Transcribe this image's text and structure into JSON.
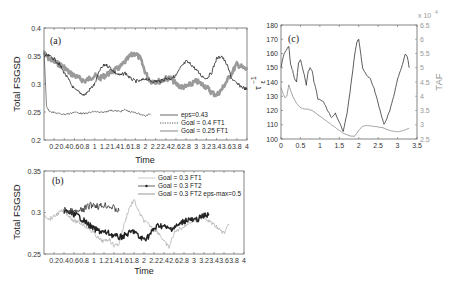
{
  "chart_data": [
    {
      "panel": "(a)",
      "type": "line",
      "xlabel": "Time",
      "ylabel": "Total  FSGSD",
      "xlim": [
        0,
        4
      ],
      "ylim": [
        0.2,
        0.4
      ],
      "xticks": [
        "0.2",
        "0.4",
        "0.6",
        "0.8",
        "1",
        "1.2",
        "1.4",
        "1.6",
        "1.8",
        "2",
        "2.2",
        "2.4",
        "2.6",
        "2.8",
        "3",
        "3.2",
        "3.4",
        "3.6",
        "3.8",
        "4"
      ],
      "yticks": [
        "0.2",
        "0.25",
        "0.3",
        "0.35",
        "0.4"
      ],
      "legend_position": "lower right",
      "series": [
        {
          "name": "eps=0.43",
          "style": "gray-thick-markers",
          "color": "#9a9a9a",
          "x": [
            0,
            0.1,
            0.2,
            0.3,
            0.4,
            0.5,
            0.6,
            0.7,
            0.8,
            0.9,
            1.0,
            1.1,
            1.2,
            1.3,
            1.4,
            1.5,
            1.6,
            1.7,
            1.8,
            1.9,
            2.0,
            2.1,
            2.2,
            2.3,
            2.4,
            2.5,
            2.6,
            2.7,
            2.8,
            2.9,
            3.0,
            3.1,
            3.2,
            3.3,
            3.4,
            3.5,
            3.6,
            3.7,
            3.8,
            3.9,
            4.0
          ],
          "y": [
            0.355,
            0.345,
            0.34,
            0.335,
            0.33,
            0.32,
            0.315,
            0.31,
            0.305,
            0.31,
            0.315,
            0.31,
            0.315,
            0.32,
            0.325,
            0.33,
            0.34,
            0.35,
            0.355,
            0.345,
            0.32,
            0.305,
            0.305,
            0.305,
            0.31,
            0.31,
            0.3,
            0.295,
            0.295,
            0.3,
            0.305,
            0.3,
            0.295,
            0.285,
            0.28,
            0.29,
            0.305,
            0.32,
            0.335,
            0.33,
            0.325
          ]
        },
        {
          "name": "Goal = 0.4   FT1",
          "style": "black-dotted",
          "color": "#222222",
          "x": [
            0,
            0.1,
            0.2,
            0.3,
            0.4,
            0.5,
            0.6,
            0.7,
            0.8,
            0.9,
            1.0,
            1.1,
            1.2,
            1.3,
            1.4,
            1.5,
            1.6,
            1.7,
            1.8,
            1.9,
            2.0,
            2.1,
            2.2,
            2.3,
            2.4,
            2.5,
            2.6,
            2.7,
            2.8,
            2.9,
            3.0,
            3.1,
            3.2,
            3.3,
            3.4,
            3.5,
            3.6,
            3.7,
            3.8,
            3.9,
            4.0
          ],
          "y": [
            0.35,
            0.35,
            0.345,
            0.335,
            0.32,
            0.305,
            0.29,
            0.285,
            0.28,
            0.29,
            0.3,
            0.325,
            0.335,
            0.33,
            0.32,
            0.315,
            0.32,
            0.31,
            0.305,
            0.305,
            0.31,
            0.305,
            0.305,
            0.305,
            0.31,
            0.31,
            0.315,
            0.33,
            0.34,
            0.335,
            0.325,
            0.315,
            0.31,
            0.32,
            0.345,
            0.35,
            0.335,
            0.31,
            0.3,
            0.295,
            0.29
          ]
        },
        {
          "name": "Goal = 0.25   FT1",
          "style": "black-thin",
          "color": "#333333",
          "x": [
            0,
            0.05,
            0.1,
            0.2,
            0.3,
            0.4,
            0.5,
            0.6,
            0.7,
            0.8,
            0.9,
            1.0,
            1.1,
            1.2,
            1.3,
            1.4,
            1.5,
            1.6,
            1.7,
            1.8,
            1.9,
            2.0,
            2.1
          ],
          "y": [
            0.36,
            0.26,
            0.252,
            0.249,
            0.247,
            0.246,
            0.247,
            0.25,
            0.248,
            0.247,
            0.249,
            0.251,
            0.249,
            0.25,
            0.253,
            0.252,
            0.251,
            0.254,
            0.25,
            0.249,
            0.246,
            0.243,
            0.247
          ]
        }
      ]
    },
    {
      "panel": "(b)",
      "type": "line",
      "xlabel": "Time",
      "ylabel": "Total  FSGSD",
      "xlim": [
        0,
        4
      ],
      "ylim": [
        0.25,
        0.35
      ],
      "xticks": [
        "0.2",
        "0.4",
        "0.6",
        "0.8",
        "1",
        "1.2",
        "1.4",
        "1.6",
        "1.8",
        "2",
        "2.2",
        "2.4",
        "2.6",
        "2.8",
        "3",
        "3.2",
        "3.4",
        "3.6",
        "3.8",
        "4"
      ],
      "yticks": [
        "0.25",
        "0.3",
        "0.35"
      ],
      "legend_position": "upper right",
      "series": [
        {
          "name": "Goal = 0.3   FT1",
          "style": "light-gray-thin",
          "color": "#aaaaaa",
          "x": [
            0,
            0.1,
            0.2,
            0.3,
            0.4,
            0.5,
            0.6,
            0.7,
            0.8,
            0.9,
            1.0,
            1.1,
            1.2,
            1.3,
            1.4,
            1.5,
            1.6,
            1.7,
            1.8,
            1.9,
            2.0,
            2.1,
            2.2,
            2.3,
            2.4,
            2.5,
            2.6,
            2.7,
            2.8,
            2.9,
            3.0,
            3.1,
            3.2,
            3.3,
            3.4,
            3.5,
            3.6,
            3.7
          ],
          "y": [
            0.298,
            0.292,
            0.295,
            0.3,
            0.302,
            0.296,
            0.29,
            0.288,
            0.285,
            0.28,
            0.275,
            0.268,
            0.265,
            0.268,
            0.26,
            0.262,
            0.285,
            0.305,
            0.315,
            0.3,
            0.29,
            0.285,
            0.28,
            0.275,
            0.265,
            0.258,
            0.275,
            0.28,
            0.283,
            0.288,
            0.29,
            0.292,
            0.295,
            0.29,
            0.285,
            0.28,
            0.275,
            0.285
          ]
        },
        {
          "name": "Goal = 0.3   FT2",
          "style": "black-markers",
          "color": "#222222",
          "x": [
            0.4,
            0.5,
            0.6,
            0.7,
            0.8,
            0.9,
            1.0,
            1.1,
            1.2,
            1.3,
            1.4,
            1.5,
            1.6,
            1.7,
            1.8,
            1.9,
            2.0,
            2.1,
            2.2,
            2.3,
            2.4,
            2.5,
            2.6,
            2.7,
            2.8,
            2.9,
            3.0,
            3.1,
            3.2,
            3.3
          ],
          "y": [
            0.302,
            0.3,
            0.298,
            0.295,
            0.29,
            0.285,
            0.28,
            0.278,
            0.276,
            0.275,
            0.272,
            0.27,
            0.272,
            0.275,
            0.278,
            0.27,
            0.268,
            0.272,
            0.28,
            0.285,
            0.283,
            0.28,
            0.282,
            0.285,
            0.29,
            0.292,
            0.29,
            0.293,
            0.296,
            0.298
          ]
        },
        {
          "name": "Goal = 0.3   FT2   eps-max=0.5",
          "style": "black-thin-upper",
          "color": "#333333",
          "x": [
            0.4,
            0.5,
            0.6,
            0.7,
            0.8,
            0.9,
            1.0,
            1.1,
            1.2,
            1.3,
            1.4,
            1.5
          ],
          "y": [
            0.303,
            0.302,
            0.3,
            0.301,
            0.304,
            0.308,
            0.31,
            0.307,
            0.309,
            0.308,
            0.305,
            0.302
          ]
        }
      ]
    },
    {
      "panel": "(c)",
      "type": "line",
      "xlabel": "",
      "ylabel": "τ_ε^-1",
      "ylabel2": "TAF",
      "y2_multiplier": "x 10^4",
      "xlim": [
        0,
        3.5
      ],
      "ylim": [
        100,
        180
      ],
      "y2lim": [
        2.5,
        6.5
      ],
      "xticks": [
        "0",
        "0.5",
        "1",
        "1.5",
        "2",
        "2.5",
        "3",
        "3.5"
      ],
      "yticks": [
        "100",
        "110",
        "120",
        "130",
        "140",
        "150",
        "160",
        "170",
        "180"
      ],
      "y2ticks": [
        "2.5",
        "3",
        "3.5",
        "4",
        "4.5",
        "5",
        "5.5",
        "6",
        "6.5"
      ],
      "series": [
        {
          "name": "tau_eps^-1",
          "axis": "left",
          "color": "#333333",
          "x": [
            0,
            0.05,
            0.1,
            0.15,
            0.2,
            0.25,
            0.3,
            0.35,
            0.4,
            0.45,
            0.5,
            0.55,
            0.6,
            0.65,
            0.7,
            0.75,
            0.8,
            0.85,
            0.9,
            0.95,
            1.0,
            1.1,
            1.2,
            1.3,
            1.4,
            1.5,
            1.6,
            1.7,
            1.8,
            1.9,
            1.95,
            2.0,
            2.05,
            2.1,
            2.2,
            2.3,
            2.4,
            2.5,
            2.6,
            2.65,
            2.7,
            2.8,
            2.9,
            3.0,
            3.1,
            3.2,
            3.25,
            3.3
          ],
          "y": [
            150,
            157,
            161,
            163,
            165,
            152,
            148,
            142,
            140,
            153,
            156,
            150,
            145,
            138,
            147,
            150,
            148,
            140,
            135,
            128,
            128,
            126,
            120,
            115,
            118,
            112,
            105,
            118,
            138,
            160,
            168,
            170,
            160,
            150,
            145,
            142,
            135,
            125,
            115,
            110,
            113,
            120,
            130,
            142,
            150,
            160,
            158,
            150
          ]
        },
        {
          "name": "TAF",
          "axis": "right",
          "color": "#888888",
          "x": [
            0,
            0.05,
            0.1,
            0.15,
            0.2,
            0.3,
            0.4,
            0.5,
            0.6,
            0.7,
            0.8,
            0.9,
            1.0,
            1.1,
            1.2,
            1.3,
            1.4,
            1.5,
            1.6,
            1.7,
            1.8,
            1.9,
            2.0,
            2.1,
            2.2,
            2.3,
            2.4,
            2.5,
            2.6,
            2.7,
            2.8,
            2.9,
            3.0,
            3.1,
            3.2,
            3.3
          ],
          "y": [
            4.3,
            4.1,
            3.95,
            4.0,
            4.4,
            4.0,
            3.75,
            3.6,
            3.55,
            3.55,
            3.5,
            3.4,
            3.3,
            3.2,
            3.1,
            3.0,
            2.9,
            2.8,
            2.7,
            2.65,
            2.6,
            2.6,
            2.8,
            2.95,
            2.97,
            2.96,
            2.94,
            2.92,
            2.9,
            2.85,
            2.8,
            2.77,
            2.75,
            2.78,
            2.82,
            2.88
          ]
        }
      ]
    }
  ],
  "labels": {
    "a_tag": "(a)",
    "b_tag": "(b)",
    "c_tag": "(c)",
    "time": "Time",
    "fsgsd": "Total  FSGSD",
    "tau": "τ",
    "tau_sub": "ε",
    "tau_sup": "−1",
    "taf": "TAF",
    "c_multiplier": "x 10",
    "c_multiplier_exp": "4",
    "legend_a": [
      "eps=0.43",
      "Goal = 0.4   FT1",
      "Goal = 0.25   FT1"
    ],
    "legend_b": [
      "Goal = 0.3   FT1",
      "Goal = 0.3   FT2",
      "Goal = 0.3   FT2   eps-max=0.5"
    ]
  }
}
